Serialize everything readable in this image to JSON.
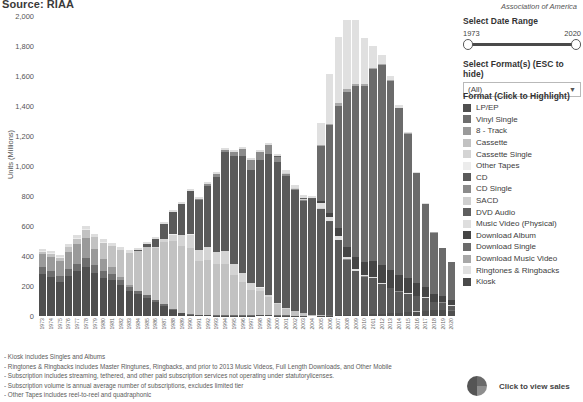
{
  "header": {
    "source_title": "Source: RIAA",
    "association": "Association of America"
  },
  "controls": {
    "date_range_label": "Select Date Range",
    "date_min": "1973",
    "date_max": "2020",
    "format_label": "Select Format(s) (ESC to hide)",
    "format_value": "(All)",
    "caret_icon": "chevron-down-icon"
  },
  "legend": {
    "title": "Format (Click to Highlight)",
    "items": [
      {
        "label": "LP/EP",
        "color": "#4f4f4f"
      },
      {
        "label": "Vinyl Single",
        "color": "#6e6e6e"
      },
      {
        "label": "8 - Track",
        "color": "#9a9a9a"
      },
      {
        "label": "Cassette",
        "color": "#c2c2c2"
      },
      {
        "label": "Cassette Single",
        "color": "#d4d4d4"
      },
      {
        "label": "Other Tapes",
        "color": "#ececec"
      },
      {
        "label": "CD",
        "color": "#5a5a5a"
      },
      {
        "label": "CD Single",
        "color": "#8b8b8b"
      },
      {
        "label": "SACD",
        "color": "#cfcfcf"
      },
      {
        "label": "DVD Audio",
        "color": "#5f5f5f"
      },
      {
        "label": "Music Video (Physical)",
        "color": "#dedede"
      },
      {
        "label": "Download Album",
        "color": "#454545"
      },
      {
        "label": "Download Single",
        "color": "#6b6b6b"
      },
      {
        "label": "Download Music Video",
        "color": "#a8a8a8"
      },
      {
        "label": "Ringtones & Ringbacks",
        "color": "#e0e0e0"
      },
      {
        "label": "Kiosk",
        "color": "#4a4a4a"
      }
    ]
  },
  "notes": [
    "- Kiosk includes Singles and Albums",
    "- Ringtones & Ringbacks includes Master Ringtunes, Ringbacks, and prior to 2013 Music  Videos, Full Length Downloads, and Other Mobile",
    "- Subscription includes streaming, tethered, and other paid subscription services not operating under statutorylicenses.",
    "- Subscription volume is annual average number of subscriptions, excludes limited tier",
    "- Other Tapes includes reel-to-reel and quadraphonic"
  ],
  "cta": {
    "icon": "pie-chart-icon",
    "label": "Click to view sales"
  },
  "chart_data": {
    "type": "bar",
    "stacked": true,
    "title": "",
    "xlabel": "",
    "ylabel": "Units (Millions)",
    "ylim": [
      0,
      2000
    ],
    "yticks": [
      0,
      200,
      400,
      600,
      800,
      1000,
      1200,
      1400,
      1600,
      1800,
      2000
    ],
    "ytick_labels": [
      "0",
      "200",
      "400",
      "600",
      "800",
      "1,000",
      "1,200",
      "1,400",
      "1,600",
      "1,800",
      "2,000"
    ],
    "grid": false,
    "legend_position": "right",
    "categories": [
      "1973",
      "1974",
      "1975",
      "1976",
      "1977",
      "1978",
      "1979",
      "1980",
      "1981",
      "1982",
      "1983",
      "1984",
      "1985",
      "1986",
      "1987",
      "1988",
      "1989",
      "1990",
      "1991",
      "1992",
      "1993",
      "1994",
      "1995",
      "1996",
      "1997",
      "1998",
      "1999",
      "2000",
      "2001",
      "2002",
      "2003",
      "2004",
      "2005",
      "2006",
      "2007",
      "2008",
      "2009",
      "2010",
      "2011",
      "2012",
      "2013",
      "2014",
      "2015",
      "2016",
      "2017",
      "2018",
      "2019",
      "2020"
    ],
    "series": [
      {
        "name": "LP/EP",
        "color": "#4f4f4f",
        "values": [
          280,
          260,
          230,
          270,
          300,
          330,
          290,
          255,
          240,
          205,
          170,
          145,
          120,
          95,
          70,
          40,
          18,
          10,
          6,
          4,
          3,
          3,
          3,
          3,
          3,
          4,
          4,
          3,
          3,
          2,
          2,
          0,
          2,
          3,
          4,
          5,
          6,
          8,
          11,
          14,
          17,
          20,
          24,
          29,
          34,
          38,
          41,
          36
        ]
      },
      {
        "name": "Vinyl Single",
        "color": "#6e6e6e",
        "values": [
          45,
          40,
          38,
          42,
          48,
          55,
          52,
          44,
          38,
          32,
          26,
          21,
          17,
          14,
          11,
          8,
          5,
          3,
          2,
          2,
          1,
          1,
          1,
          1,
          1,
          1,
          1,
          1,
          1,
          1,
          1,
          0,
          1,
          1,
          1,
          1,
          1,
          1,
          1,
          1,
          1,
          1,
          1,
          1,
          1,
          1,
          1,
          1
        ]
      },
      {
        "name": "8 - Track",
        "color": "#9a9a9a",
        "values": [
          90,
          95,
          100,
          115,
          130,
          135,
          105,
          80,
          50,
          25,
          10,
          4,
          1,
          0,
          0,
          0,
          0,
          0,
          0,
          0,
          0,
          0,
          0,
          0,
          0,
          0,
          0,
          0,
          0,
          0,
          0,
          0,
          0,
          0,
          0,
          0,
          0,
          0,
          0,
          0,
          0,
          0,
          0,
          0,
          0,
          0,
          0,
          0
        ]
      },
      {
        "name": "Cassette",
        "color": "#c2c2c2",
        "values": [
          15,
          18,
          22,
          30,
          38,
          55,
          78,
          110,
          140,
          180,
          215,
          265,
          320,
          345,
          410,
          450,
          446,
          442,
          360,
          366,
          340,
          345,
          272,
          225,
          172,
          159,
          123,
          76,
          45,
          31,
          17,
          10,
          5,
          3,
          2,
          1,
          1,
          1,
          1,
          1,
          1,
          1,
          1,
          1,
          1,
          1,
          1,
          1
        ]
      },
      {
        "name": "Cassette Single",
        "color": "#d4d4d4",
        "values": [
          0,
          0,
          0,
          0,
          0,
          0,
          0,
          0,
          0,
          0,
          0,
          0,
          0,
          5,
          20,
          45,
          70,
          88,
          70,
          85,
          85,
          82,
          70,
          60,
          42,
          26,
          14,
          5,
          2,
          1,
          0,
          0,
          0,
          0,
          0,
          0,
          0,
          0,
          0,
          0,
          0,
          0,
          0,
          0,
          0,
          0,
          0,
          0
        ]
      },
      {
        "name": "Other Tapes",
        "color": "#ececec",
        "values": [
          6,
          5,
          5,
          4,
          4,
          3,
          3,
          2,
          2,
          1,
          1,
          1,
          1,
          1,
          1,
          1,
          1,
          1,
          1,
          1,
          1,
          1,
          1,
          1,
          1,
          1,
          1,
          1,
          0,
          0,
          0,
          0,
          0,
          0,
          0,
          0,
          0,
          0,
          0,
          0,
          0,
          0,
          0,
          0,
          0,
          0,
          0,
          0
        ]
      },
      {
        "name": "CD",
        "color": "#5a5a5a",
        "values": [
          0,
          0,
          0,
          0,
          0,
          0,
          0,
          0,
          0,
          0,
          1,
          6,
          23,
          53,
          102,
          150,
          207,
          287,
          333,
          408,
          495,
          662,
          723,
          779,
          753,
          847,
          939,
          942,
          882,
          803,
          746,
          767,
          705,
          620,
          500,
          368,
          293,
          253,
          241,
          198,
          165,
          141,
          123,
          100,
          85,
          52,
          47,
          31
        ]
      },
      {
        "name": "CD Single",
        "color": "#8b8b8b",
        "values": [
          0,
          0,
          0,
          0,
          0,
          0,
          0,
          0,
          0,
          0,
          0,
          0,
          0,
          0,
          0,
          0,
          0,
          1,
          6,
          12,
          22,
          10,
          22,
          43,
          66,
          56,
          56,
          34,
          17,
          11,
          8,
          3,
          3,
          2,
          2,
          2,
          1,
          1,
          1,
          1,
          1,
          1,
          1,
          1,
          1,
          1,
          1,
          1
        ]
      },
      {
        "name": "SACD",
        "color": "#cfcfcf",
        "values": [
          0,
          0,
          0,
          0,
          0,
          0,
          0,
          0,
          0,
          0,
          0,
          0,
          0,
          0,
          0,
          0,
          0,
          0,
          0,
          0,
          0,
          0,
          0,
          0,
          0,
          0,
          0,
          1,
          2,
          4,
          5,
          3,
          2,
          1,
          0,
          0,
          0,
          0,
          0,
          0,
          0,
          0,
          0,
          0,
          0,
          0,
          0,
          0
        ]
      },
      {
        "name": "DVD Audio",
        "color": "#5f5f5f",
        "values": [
          0,
          0,
          0,
          0,
          0,
          0,
          0,
          0,
          0,
          0,
          0,
          0,
          0,
          0,
          0,
          0,
          0,
          0,
          0,
          0,
          0,
          0,
          0,
          0,
          0,
          0,
          0,
          1,
          2,
          4,
          5,
          3,
          2,
          1,
          0,
          0,
          0,
          0,
          0,
          0,
          0,
          0,
          0,
          0,
          0,
          0,
          0,
          0
        ]
      },
      {
        "name": "Music Video (Physical)",
        "color": "#dedede",
        "values": [
          12,
          14,
          15,
          16,
          18,
          22,
          22,
          20,
          18,
          16,
          14,
          14,
          14,
          14,
          14,
          14,
          14,
          14,
          14,
          14,
          14,
          14,
          14,
          14,
          14,
          14,
          14,
          18,
          18,
          18,
          20,
          16,
          34,
          28,
          25,
          18,
          13,
          10,
          8,
          6,
          5,
          4,
          3,
          3,
          2,
          2,
          2,
          2
        ]
      },
      {
        "name": "Download Album",
        "color": "#454545",
        "values": [
          0,
          0,
          0,
          0,
          0,
          0,
          0,
          0,
          0,
          0,
          0,
          0,
          0,
          0,
          0,
          0,
          0,
          0,
          0,
          0,
          0,
          0,
          0,
          0,
          0,
          0,
          0,
          0,
          0,
          0,
          0,
          0,
          14,
          28,
          50,
          66,
          78,
          86,
          106,
          118,
          118,
          107,
          98,
          85,
          68,
          53,
          43,
          34
        ]
      },
      {
        "name": "Download Single",
        "color": "#6b6b6b",
        "values": [
          0,
          0,
          0,
          0,
          0,
          0,
          0,
          0,
          0,
          0,
          0,
          0,
          0,
          0,
          0,
          0,
          0,
          0,
          0,
          0,
          0,
          0,
          0,
          0,
          0,
          0,
          0,
          0,
          0,
          0,
          0,
          0,
          367,
          586,
          819,
          1033,
          1138,
          1172,
          1276,
          1336,
          1258,
          1110,
          964,
          734,
          554,
          409,
          317,
          253
        ]
      },
      {
        "name": "Download Music Video",
        "color": "#a8a8a8",
        "values": [
          0,
          0,
          0,
          0,
          0,
          0,
          0,
          0,
          0,
          0,
          0,
          0,
          0,
          0,
          0,
          0,
          0,
          0,
          0,
          0,
          0,
          0,
          0,
          0,
          0,
          0,
          0,
          0,
          0,
          0,
          0,
          0,
          4,
          8,
          14,
          17,
          15,
          12,
          10,
          8,
          6,
          4,
          3,
          2,
          2,
          1,
          1,
          1
        ]
      },
      {
        "name": "Ringtones & Ringbacks",
        "color": "#e0e0e0",
        "values": [
          0,
          0,
          0,
          0,
          0,
          0,
          0,
          0,
          0,
          0,
          0,
          0,
          0,
          0,
          0,
          0,
          0,
          0,
          0,
          0,
          0,
          0,
          0,
          0,
          0,
          0,
          0,
          0,
          0,
          0,
          0,
          0,
          150,
          330,
          440,
          465,
          430,
          310,
          145,
          55,
          30,
          18,
          10,
          6,
          4,
          3,
          2,
          2
        ]
      },
      {
        "name": "Kiosk",
        "color": "#4a4a4a",
        "values": [
          0,
          0,
          0,
          0,
          0,
          0,
          0,
          0,
          0,
          0,
          0,
          0,
          0,
          0,
          0,
          0,
          0,
          0,
          0,
          0,
          0,
          0,
          0,
          0,
          0,
          0,
          0,
          0,
          0,
          0,
          0,
          0,
          0,
          0,
          0,
          1,
          1,
          1,
          1,
          1,
          1,
          1,
          1,
          1,
          1,
          1,
          1,
          1
        ]
      }
    ],
    "totals": [
      620,
      595,
      535,
      594,
      700,
      730,
      686,
      652,
      626,
      577,
      578,
      677,
      645,
      617,
      706,
      765,
      805,
      855,
      795,
      880,
      955,
      1130,
      1111,
      1145,
      1060,
      1125,
      1168,
      1120,
      1000,
      915,
      855,
      800,
      1290,
      1615,
      1860,
      1940,
      1840,
      1745,
      1845,
      1805,
      1705,
      1455,
      1265,
      970,
      735,
      525,
      440,
      360
    ]
  }
}
